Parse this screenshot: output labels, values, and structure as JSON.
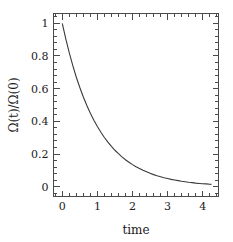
{
  "chart_data": {
    "type": "line",
    "title": "",
    "subtitle": "",
    "xlabel": "time",
    "ylabel": "Ω(t)/Ω(0)",
    "xlim": [
      -0.25,
      4.45
    ],
    "ylim": [
      -0.06,
      1.06
    ],
    "xticks": [
      0,
      1,
      2,
      3,
      4
    ],
    "xtick_labels": [
      "0",
      "1",
      "2",
      "3",
      "4"
    ],
    "yticks": [
      0,
      0.2,
      0.4,
      0.6,
      0.8,
      1
    ],
    "ytick_labels": [
      "0",
      "0.2",
      "0.4",
      "0.6",
      "0.8",
      "1"
    ],
    "x_minor_per_major": 5,
    "y_minor_per_major": 5,
    "grid": false,
    "legend": null,
    "ticks_direction": "in",
    "frame": "box",
    "line_color": "#3a3a3a",
    "axis_color": "#4a4a4a",
    "background": "#ffffff",
    "series": [
      {
        "name": "Ω(t)/Ω(0)",
        "function": "exp(-t)",
        "x": [
          0.0,
          0.1,
          0.2,
          0.3,
          0.4,
          0.5,
          0.6,
          0.7,
          0.8,
          0.9,
          1.0,
          1.1,
          1.2,
          1.3,
          1.4,
          1.5,
          1.6,
          1.7,
          1.8,
          1.9,
          2.0,
          2.1,
          2.2,
          2.3,
          2.4,
          2.5,
          2.6,
          2.7,
          2.8,
          2.9,
          3.0,
          3.1,
          3.2,
          3.3,
          3.4,
          3.5,
          3.6,
          3.7,
          3.8,
          3.9,
          4.0,
          4.1,
          4.2,
          4.25
        ],
        "y": [
          1.0,
          0.905,
          0.819,
          0.741,
          0.67,
          0.607,
          0.549,
          0.497,
          0.449,
          0.407,
          0.368,
          0.333,
          0.301,
          0.273,
          0.247,
          0.223,
          0.202,
          0.183,
          0.165,
          0.15,
          0.135,
          0.122,
          0.111,
          0.1,
          0.091,
          0.082,
          0.074,
          0.067,
          0.061,
          0.055,
          0.05,
          0.045,
          0.041,
          0.037,
          0.033,
          0.03,
          0.027,
          0.025,
          0.022,
          0.02,
          0.018,
          0.017,
          0.015,
          0.014
        ]
      }
    ]
  },
  "axes": {
    "y_axis_title": "Ω(t)/Ω(0)",
    "x_axis_title": "time"
  }
}
